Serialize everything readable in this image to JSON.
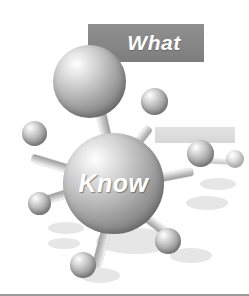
{
  "image": {
    "title": "What Know molecule illustration",
    "style": "grayscale clipart",
    "background_color": "#ffffff"
  },
  "banners": [
    {
      "name": "what-banner",
      "label": "What",
      "background_color": "#878787",
      "text_color": "#ffffff",
      "x": 88,
      "y": 24,
      "w": 116,
      "h": 38
    },
    {
      "name": "secondary-banner",
      "label": "",
      "background_color": "#dcdcdc",
      "text_color": "#dcdcdc",
      "x": 155,
      "y": 127,
      "w": 80,
      "h": 16
    }
  ],
  "core": {
    "label": "Know",
    "text_color": "#ffffff",
    "x": 63,
    "y": 133,
    "d": 101
  },
  "spheres": [
    {
      "name": "sphere-top-large",
      "x": 53,
      "y": 45,
      "d": 73,
      "kind": "large"
    },
    {
      "name": "sphere-upper-right",
      "x": 141,
      "y": 88,
      "d": 27,
      "kind": "small"
    },
    {
      "name": "sphere-left",
      "x": 22,
      "y": 121,
      "d": 25,
      "kind": "small"
    },
    {
      "name": "sphere-right",
      "x": 187,
      "y": 140,
      "d": 27,
      "kind": "small"
    },
    {
      "name": "sphere-lower-left",
      "x": 28,
      "y": 192,
      "d": 23,
      "kind": "small"
    },
    {
      "name": "sphere-lower-right",
      "x": 155,
      "y": 228,
      "d": 26,
      "kind": "small"
    },
    {
      "name": "sphere-bottom",
      "x": 70,
      "y": 252,
      "d": 26,
      "kind": "small"
    },
    {
      "name": "sphere-far-right-pale",
      "x": 226,
      "y": 150,
      "d": 18,
      "kind": "pale"
    }
  ],
  "bonds": [
    {
      "name": "bond-core-to-top",
      "x": 113,
      "y": 165,
      "len": 62,
      "angle": -103,
      "w": 10
    },
    {
      "name": "bond-core-to-upper-right",
      "x": 122,
      "y": 163,
      "len": 45,
      "angle": -52,
      "w": 8
    },
    {
      "name": "bond-core-to-left",
      "x": 72,
      "y": 170,
      "len": 42,
      "angle": 197,
      "w": 8
    },
    {
      "name": "bond-core-to-right",
      "x": 150,
      "y": 180,
      "len": 44,
      "angle": -11,
      "w": 8
    },
    {
      "name": "bond-core-to-lower-left",
      "x": 72,
      "y": 192,
      "len": 32,
      "angle": 163,
      "w": 8
    },
    {
      "name": "bond-core-to-lower-right",
      "x": 140,
      "y": 213,
      "len": 38,
      "angle": 37,
      "w": 8
    },
    {
      "name": "bond-core-to-bottom",
      "x": 107,
      "y": 226,
      "len": 42,
      "angle": 105,
      "w": 9
    },
    {
      "name": "bond-faint-right-far",
      "x": 200,
      "y": 160,
      "len": 30,
      "angle": 3,
      "w": 6
    }
  ],
  "shadows": [
    {
      "name": "shadow-core",
      "x": 96,
      "y": 228,
      "w": 78,
      "h": 26
    },
    {
      "name": "shadow-bottom-ball",
      "x": 80,
      "y": 268,
      "w": 40,
      "h": 15
    },
    {
      "name": "shadow-lower-right",
      "x": 170,
      "y": 248,
      "w": 42,
      "h": 15
    },
    {
      "name": "shadow-mid-left",
      "x": 48,
      "y": 222,
      "w": 36,
      "h": 12
    },
    {
      "name": "shadow-low-left",
      "x": 48,
      "y": 238,
      "w": 32,
      "h": 11
    },
    {
      "name": "shadow-right-band",
      "x": 186,
      "y": 196,
      "w": 42,
      "h": 14
    },
    {
      "name": "shadow-far-right",
      "x": 200,
      "y": 178,
      "w": 36,
      "h": 12
    },
    {
      "name": "shadow-upper-mid",
      "x": 120,
      "y": 214,
      "w": 30,
      "h": 11
    }
  ]
}
